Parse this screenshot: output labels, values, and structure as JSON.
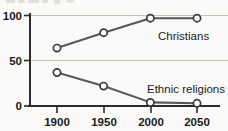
{
  "chart_data": {
    "type": "line",
    "title": "",
    "subtitle": "",
    "xlabel": "",
    "ylabel": "",
    "x": [
      1900,
      1950,
      2000,
      2050
    ],
    "categories": [
      "1900",
      "1950",
      "2000",
      "2050"
    ],
    "xlim": [
      1880,
      2070
    ],
    "ylim": [
      0,
      108
    ],
    "yticks": [
      0,
      50,
      100
    ],
    "ytick_labels": [
      "0",
      "50",
      "100"
    ],
    "xtick_labels": [
      "1900",
      "1950",
      "2000",
      "2050"
    ],
    "grid": "horizontal",
    "legend_position": "inline-annotations",
    "series": [
      {
        "name": "Christians",
        "values": [
          64,
          81,
          97,
          97
        ],
        "label": "Christians",
        "label_x": 2005,
        "label_y": 78,
        "color": "#58585a",
        "marker": "open-circle"
      },
      {
        "name": "Ethnic religions",
        "values": [
          37,
          22,
          4,
          3
        ],
        "label": "Ethnic religions",
        "label_x": 1998,
        "label_y": 27,
        "color": "#58585a",
        "marker": "open-circle"
      }
    ]
  },
  "axes": {
    "y_axis_name": "y-axis",
    "x_axis_name": "x-axis"
  },
  "colors": {
    "line": "#58585a",
    "marker_fill": "#ffffff",
    "marker_stroke": "#3a3a3a",
    "grid": "#b9b6b1",
    "axis": "#2b2b2b",
    "text": "#1a1a1a",
    "background": "#fbfaf8"
  }
}
